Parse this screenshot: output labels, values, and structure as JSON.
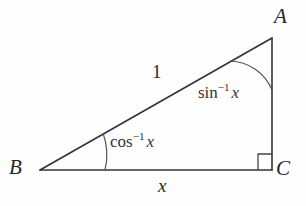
{
  "figure": {
    "kind": "right-triangle-diagram",
    "background_color": "#fefefe",
    "stroke_color": "#333333",
    "text_color": "#2b2b2b"
  },
  "vertices": {
    "A": {
      "label": "A",
      "x": 272,
      "y": 38
    },
    "B": {
      "label": "B",
      "x": 40,
      "y": 170
    },
    "C": {
      "label": "C",
      "x": 272,
      "y": 170
    }
  },
  "sides": {
    "hypotenuse": {
      "label": "1",
      "from": "B",
      "to": "A"
    },
    "base": {
      "label": "x",
      "from": "B",
      "to": "C"
    },
    "vertical": {
      "label": "",
      "from": "A",
      "to": "C"
    }
  },
  "angles": {
    "at_A": {
      "function": "sin",
      "superscript": "−1",
      "variable": "x",
      "text": "sin−1 x"
    },
    "at_B": {
      "function": "cos",
      "superscript": "−1",
      "variable": "x",
      "text": "cos−1 x"
    },
    "at_C": {
      "marker": "right-angle-square",
      "value": "90"
    }
  },
  "geometry": {
    "hypotenuse_path": "M 40 170 L 272 38",
    "base_path": "M 40 170 L 272 170",
    "vertical_path": "M 272 38 L 272 170",
    "arc_at_A": "M 230 61 A 47 47 0 0 1 272 90",
    "arc_at_B": "M 103 133 A 64 64 0 0 1 105 170",
    "right_angle_square": "M 258 170 L 258 154 L 272 154",
    "stroke_width": 1.5
  }
}
